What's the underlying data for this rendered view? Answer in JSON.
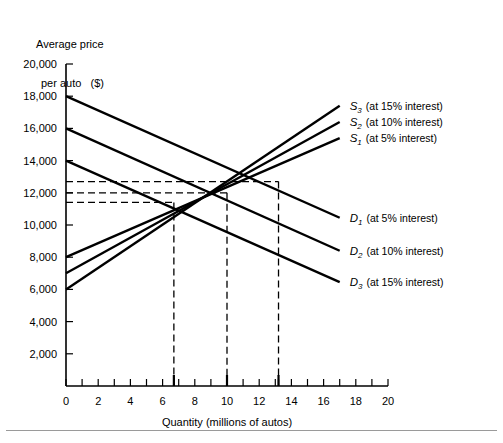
{
  "chart_data": {
    "type": "line",
    "title": "",
    "ylabel": "Average price\nper auto   ($)",
    "ylabel_line1": "Average price",
    "ylabel_line2": "per auto   ($)",
    "xlabel": "Quantity (millions of autos)",
    "xlim": [
      0,
      20
    ],
    "ylim": [
      0,
      20000
    ],
    "x_ticks": [
      0,
      1,
      2,
      3,
      4,
      5,
      6,
      7,
      8,
      9,
      10,
      11,
      12,
      13,
      14,
      15,
      16,
      17,
      18,
      19,
      20
    ],
    "x_tick_labels": [
      "0",
      "2",
      "4",
      "6",
      "8",
      "10",
      "12",
      "14",
      "16",
      "18",
      "20"
    ],
    "x_tick_label_values": [
      0,
      2,
      4,
      6,
      8,
      10,
      12,
      14,
      16,
      18,
      20
    ],
    "y_ticks": [
      2000,
      4000,
      6000,
      8000,
      10000,
      12000,
      14000,
      16000,
      18000,
      20000
    ],
    "y_tick_labels": [
      "2,000",
      "4,000",
      "6,000",
      "8,000",
      "10,000",
      "12,000",
      "14,000",
      "16,000",
      "18,000",
      "20,000"
    ],
    "grid": false,
    "legend_position": "right-of-plot-inline",
    "series": [
      {
        "name": "S3",
        "label": "S",
        "subscript": "3",
        "note": "(at 15% interest)",
        "kind": "supply",
        "x": [
          0,
          17
        ],
        "values": [
          6000,
          17400
        ]
      },
      {
        "name": "S2",
        "label": "S",
        "subscript": "2",
        "note": "(at 10% interest)",
        "kind": "supply",
        "x": [
          0,
          17
        ],
        "values": [
          7000,
          16400
        ]
      },
      {
        "name": "S1",
        "label": "S",
        "subscript": "1",
        "note": "(at 5% interest)",
        "kind": "supply",
        "x": [
          0,
          17
        ],
        "values": [
          8000,
          15400
        ]
      },
      {
        "name": "D1",
        "label": "D",
        "subscript": "1",
        "note": "(at 5% interest)",
        "kind": "demand",
        "x": [
          0,
          17
        ],
        "values": [
          18000,
          10450
        ]
      },
      {
        "name": "D2",
        "label": "D",
        "subscript": "2",
        "note": "(at 10% interest)",
        "kind": "demand",
        "x": [
          0,
          17
        ],
        "values": [
          16000,
          8400
        ]
      },
      {
        "name": "D3",
        "label": "D",
        "subscript": "3",
        "note": "(at 15% interest)",
        "kind": "demand",
        "x": [
          0,
          17
        ],
        "values": [
          14000,
          6450
        ]
      }
    ],
    "equilibria": [
      {
        "label": "E3",
        "quantity": 6.7,
        "price": 11400
      },
      {
        "label": "E2",
        "quantity": 10.0,
        "price": 12000
      },
      {
        "label": "E1",
        "quantity": 13.2,
        "price": 12700
      }
    ],
    "guide_prices": [
      12700,
      12000,
      11400
    ],
    "guide_quantities": [
      6.7,
      10.0,
      13.2
    ],
    "colors": {
      "curve": "#000000",
      "axis": "#000000",
      "guide": "#000000",
      "background": "#ffffff"
    }
  }
}
